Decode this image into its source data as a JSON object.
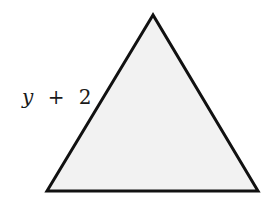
{
  "diagram": {
    "shape": "triangle",
    "vertices": [
      [
        153,
        15
      ],
      [
        47,
        191
      ],
      [
        258,
        191
      ]
    ],
    "fill": "#f2f2f2",
    "stroke": "#111111",
    "stroke_width": 3,
    "labels": {
      "left_side": {
        "variable": "y",
        "operator": "+",
        "constant": "2"
      }
    }
  }
}
